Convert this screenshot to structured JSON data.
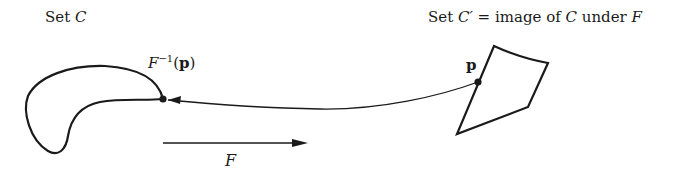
{
  "labels": {
    "set_c": {
      "prefix": "Set ",
      "symbol": "C"
    },
    "set_c_prime": {
      "prefix": "Set ",
      "symbol": "C′",
      "rest": " = image of ",
      "symbol2": "C",
      "rest2": " under ",
      "symbol3": "F"
    },
    "preimage": {
      "func": "F",
      "exp": "−1",
      "open": "(",
      "arg": "p",
      "close": ")"
    },
    "point_p": "p",
    "map_arrow": "F"
  },
  "colors": {
    "stroke": "#1a1a1a",
    "background": "#ffffff"
  }
}
